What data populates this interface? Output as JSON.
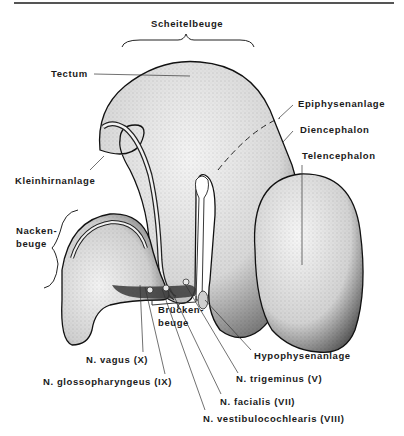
{
  "figure": {
    "labels": {
      "scheitelbeuge": "Scheitelbeuge",
      "tectum": "Tectum",
      "epiphysenanlage": "Epiphysenanlage",
      "diencephalon": "Diencephalon",
      "telencephalon": "Telencephalon",
      "kleinhirnanlage": "Kleinhirnanlage",
      "nackenbeuge_1": "Nacken-",
      "nackenbeuge_2": "beuge",
      "brueckenbeuge_1": "Brücken-",
      "brueckenbeuge_2": "beuge",
      "hypophysenanlage": "Hypophysenanlage",
      "n_vagus": "N.  vagus  (X)",
      "n_glossopharyngeus": "N.  glossopharyngeus  (IX)",
      "n_trigeminus": "N.  trigeminus  (V)",
      "n_facialis": "N.  facialis  (VII)",
      "n_vestibulocochlearis": "N.  vestibulocochlearis  (VIII)"
    }
  }
}
